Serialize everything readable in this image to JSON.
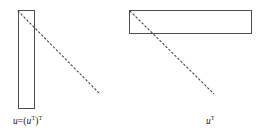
{
  "figure": {
    "kind": "matrix-transpose-diagram",
    "background_color": "#ffffff",
    "stroke_color": "#4d4d4d",
    "dash_color": "#3c3c52",
    "text_color": "#1a1a1a",
    "panels": [
      {
        "id": "column-vector",
        "role": "original-vector",
        "shape": "tall-narrow-rectangle",
        "rect": {
          "x": 18,
          "y": 10,
          "width": 16,
          "height": 98
        },
        "diagonal": {
          "x1": 18,
          "y1": 11,
          "x2": 99,
          "y2": 93,
          "style": "dashed"
        },
        "label": {
          "base": "u",
          "equals": "=(",
          "inner_var": "u",
          "inner_sup": "T",
          "close": ")",
          "outer_sup": "T",
          "plain": "u=(uᵀ)ᵀ",
          "x": 13,
          "y": 117
        }
      },
      {
        "id": "row-vector",
        "role": "transposed-vector",
        "shape": "wide-flat-rectangle",
        "rect": {
          "x": 129,
          "y": 10,
          "width": 122,
          "height": 23
        },
        "diagonal": {
          "x1": 130,
          "y1": 11,
          "x2": 214,
          "y2": 94,
          "style": "dashed"
        },
        "label": {
          "base": "u",
          "outer_sup": "T",
          "plain": "uᵀ",
          "x": 206,
          "y": 117
        }
      }
    ],
    "dash_pattern": "1.6 2.6",
    "stroke_width": 1
  }
}
